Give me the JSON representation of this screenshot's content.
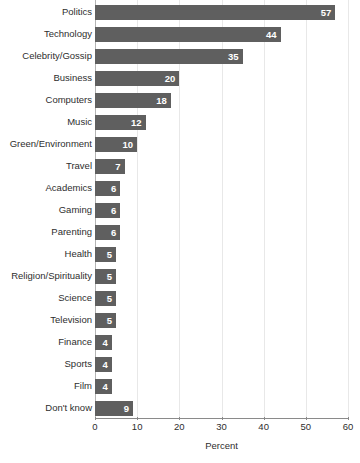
{
  "chart_data": {
    "type": "bar",
    "orientation": "horizontal",
    "title": "",
    "xlabel": "Percent",
    "ylabel": "",
    "xlim": [
      0,
      60
    ],
    "xticks": [
      0,
      10,
      20,
      30,
      40,
      50,
      60
    ],
    "xtick_labels": [
      "0",
      "10",
      "20",
      "30",
      "40",
      "50",
      "60"
    ],
    "grid": true,
    "grid_axis": "x",
    "legend": false,
    "categories": [
      "Politics",
      "Technology",
      "Celebrity/Gossip",
      "Business",
      "Computers",
      "Music",
      "Green/Environment",
      "Travel",
      "Academics",
      "Gaming",
      "Parenting",
      "Health",
      "Religion/Spirituality",
      "Science",
      "Television",
      "Finance",
      "Sports",
      "Film",
      "Don't know"
    ],
    "values": [
      57,
      44,
      35,
      20,
      18,
      12,
      10,
      7,
      6,
      6,
      6,
      5,
      5,
      5,
      5,
      4,
      4,
      4,
      9
    ],
    "value_labels": [
      "57",
      "44",
      "35",
      "20",
      "18",
      "12",
      "10",
      "7",
      "6",
      "6",
      "6",
      "5",
      "5",
      "5",
      "5",
      "4",
      "4",
      "4",
      "9"
    ],
    "bar_color": "#5f5f5f",
    "value_label_color": "#ffffff",
    "gridline_color": "#e8e8e8",
    "axis_color": "#8a8a8a",
    "text_color": "#2e2e2e",
    "background_color": "#ffffff"
  }
}
